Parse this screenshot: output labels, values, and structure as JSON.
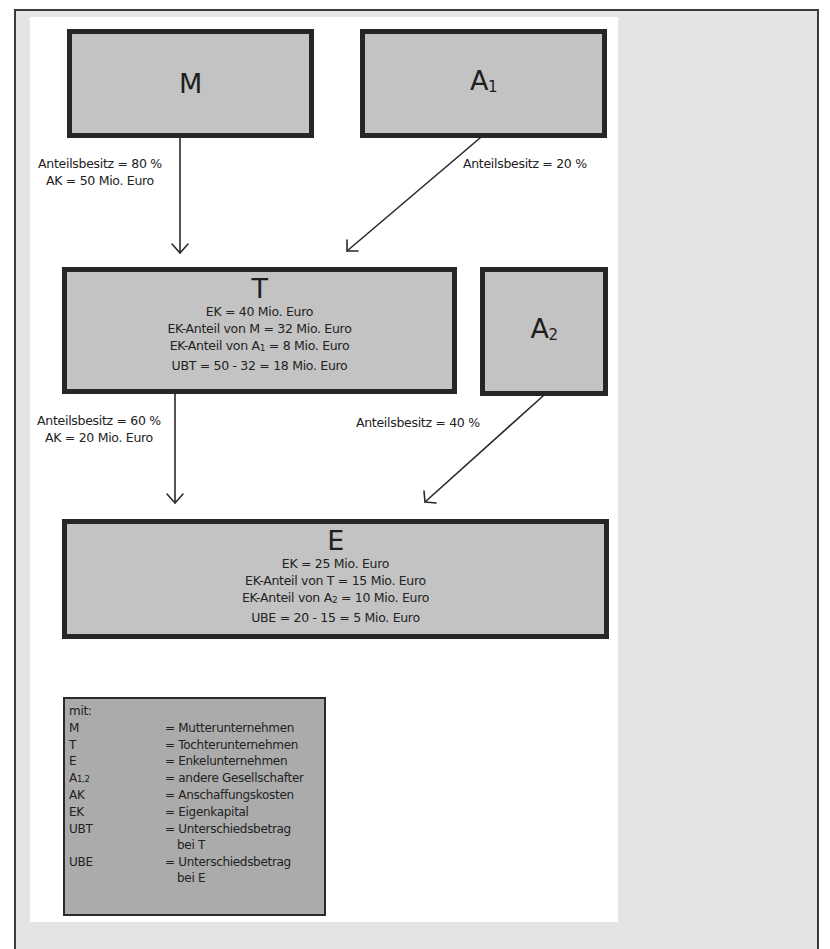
{
  "diagram": {
    "type": "ownership-structure",
    "colors": {
      "box_fill": "#c3c3c3",
      "box_border": "#262626",
      "legend_fill": "#ababab",
      "panel_bg": "#ffffff",
      "frame_bg": "#e4e4e4"
    },
    "nodes": {
      "M": {
        "label": "M",
        "subscript": ""
      },
      "A1": {
        "label": "A",
        "subscript": "1"
      },
      "T": {
        "label": "T",
        "lines": [
          "EK = 40 Mio.  Euro",
          "EK-Anteil von M = 32 Mio. Euro",
          {
            "prefix": "EK-Anteil von A",
            "subscript": "1",
            "suffix": " = 8 Mio. Euro"
          },
          "UBT = 50 - 32 = 18 Mio. Euro"
        ]
      },
      "A2": {
        "label": "A",
        "subscript": "2"
      },
      "E": {
        "label": "E",
        "lines": [
          "EK = 25 Mio.  Euro",
          "EK-Anteil von T = 15 Mio. Euro",
          {
            "prefix": "EK-Anteil von A",
            "subscript": "2",
            "suffix": " = 10 Mio. Euro"
          },
          "UBE = 20 - 15 = 5 Mio. Euro"
        ]
      }
    },
    "edges": [
      {
        "from": "M",
        "to": "T",
        "lines": [
          "Anteilsbesitz = 80 %",
          "AK = 50 Mio.  Euro"
        ]
      },
      {
        "from": "A1",
        "to": "T",
        "lines": [
          "Anteilsbesitz = 20 %"
        ]
      },
      {
        "from": "T",
        "to": "E",
        "lines": [
          "Anteilsbesitz = 60 %",
          "AK = 20 Mio.  Euro"
        ]
      },
      {
        "from": "A2",
        "to": "E",
        "lines": [
          "Anteilsbesitz = 40 %"
        ]
      }
    ],
    "legend": {
      "title": "mit:",
      "entries": [
        {
          "abbr": "M",
          "abbr_sub": "",
          "def": "= Mutterunternehmen",
          "def_cont": ""
        },
        {
          "abbr": "T",
          "abbr_sub": "",
          "def": "= Tochterunternehmen",
          "def_cont": ""
        },
        {
          "abbr": "E",
          "abbr_sub": "",
          "def": "= Enkelunternehmen",
          "def_cont": ""
        },
        {
          "abbr": "A",
          "abbr_sub": "1,2",
          "def": "= andere Gesellschafter",
          "def_cont": ""
        },
        {
          "abbr": "AK",
          "abbr_sub": "",
          "def": "= Anschaffungskosten",
          "def_cont": ""
        },
        {
          "abbr": "EK",
          "abbr_sub": "",
          "def": "= Eigenkapital",
          "def_cont": ""
        },
        {
          "abbr": "UBT",
          "abbr_sub": "",
          "def": "= Unterschiedsbetrag",
          "def_cont": "bei T"
        },
        {
          "abbr": "UBE",
          "abbr_sub": "",
          "def": "= Unterschiedsbetrag",
          "def_cont": "bei E"
        }
      ]
    }
  }
}
